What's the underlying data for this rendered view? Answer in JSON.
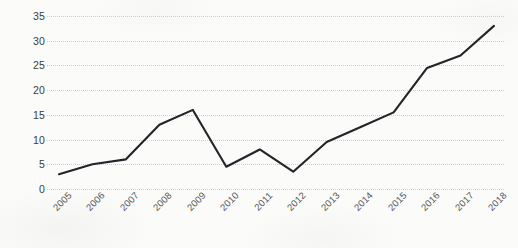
{
  "chart_data": {
    "type": "line",
    "title": "",
    "subtitle": "",
    "xlabel": "",
    "ylabel": "",
    "categories": [
      "2005",
      "2006",
      "2007",
      "2008",
      "2009",
      "2010",
      "2011",
      "2012",
      "2013",
      "2014",
      "2015",
      "2016",
      "2017",
      "2018"
    ],
    "series": [
      {
        "name": "",
        "values": [
          3,
          5,
          6,
          13,
          16,
          4.5,
          8,
          3.5,
          9.5,
          12.5,
          15.5,
          24.5,
          27,
          33
        ]
      }
    ],
    "ylim": [
      0,
      35
    ],
    "y_ticks": [
      0,
      5,
      10,
      15,
      20,
      25,
      30,
      35
    ],
    "y_tick_labels": [
      "0",
      "5",
      "10",
      "15",
      "20",
      "25",
      "30",
      "35"
    ],
    "grid": {
      "horizontal": true,
      "vertical": false,
      "style": "dotted",
      "color": "#cfcfcc"
    },
    "legend": {
      "visible": false,
      "position": "none",
      "entries": []
    },
    "axis_lines": {
      "x_axis_visible": false,
      "y_axis_visible": false
    },
    "x_tick_label_rotation": -45,
    "line_color": "#23232a",
    "line_width": 2.1,
    "markers": false,
    "background_color": "#fbfbf9"
  }
}
